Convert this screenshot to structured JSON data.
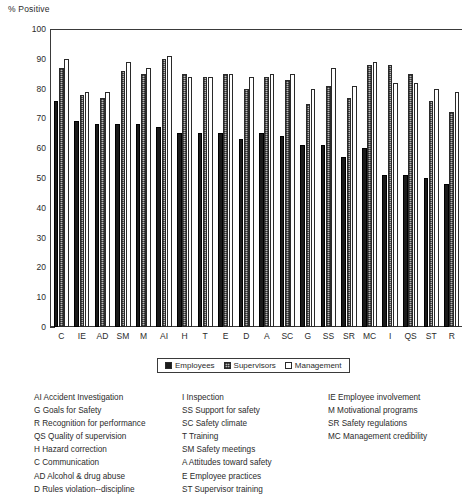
{
  "chart_data": {
    "type": "bar",
    "title": "% Positive",
    "xlabel": "",
    "ylabel": "% Positive",
    "ylim": [
      0,
      100
    ],
    "ytick_step": 10,
    "yticks": [
      0,
      10,
      20,
      30,
      40,
      50,
      60,
      70,
      80,
      90,
      100
    ],
    "grid": false,
    "legend_position": "below-axes-center",
    "categories": [
      "C",
      "IE",
      "AD",
      "SM",
      "M",
      "AI",
      "H",
      "T",
      "E",
      "D",
      "A",
      "SC",
      "G",
      "SS",
      "SR",
      "MC",
      "I",
      "QS",
      "ST",
      "R"
    ],
    "series": [
      {
        "name": "Employees",
        "color": "#1b1b1b",
        "values": [
          76,
          69,
          68,
          68,
          68,
          67,
          65,
          65,
          65,
          63,
          65,
          64,
          61,
          61,
          57,
          60,
          51,
          51,
          50,
          48
        ]
      },
      {
        "name": "Supervisors",
        "color": "#b9b9b9",
        "values": [
          87,
          78,
          77,
          86,
          85,
          90,
          85,
          84,
          85,
          80,
          84,
          83,
          75,
          81,
          77,
          88,
          88,
          85,
          76,
          72
        ]
      },
      {
        "name": "Management",
        "color": "#ffffff",
        "values": [
          90,
          79,
          79,
          89,
          87,
          91,
          84,
          84,
          85,
          84,
          85,
          85,
          80,
          87,
          81,
          89,
          82,
          82,
          80,
          79
        ]
      }
    ]
  },
  "chart": {
    "axis_title": "% Positive",
    "legend": [
      {
        "label": "Employees",
        "swatch": "s-employees"
      },
      {
        "label": "Supervisors",
        "swatch": "s-supervisors"
      },
      {
        "label": "Management",
        "swatch": "s-management"
      }
    ]
  },
  "key": {
    "column1": [
      "AI Accident Investigation",
      "G Goals for Safety",
      "R Recognition for performance",
      "QS Quality of supervision",
      "H Hazard correction",
      "C Communication",
      "AD Alcohol & drug abuse",
      "D Rules violation--discipline"
    ],
    "column2": [
      "I Inspection",
      "SS Support for safety",
      "SC Safety climate",
      "T Training",
      "SM Safety meetings",
      "A Attitudes toward safety",
      "E Employee practices",
      "ST Supervisor training"
    ],
    "column3": [
      "IE Employee involvement",
      "M Motivational programs",
      "SR Safety regulations",
      "MC Management credibility"
    ]
  }
}
